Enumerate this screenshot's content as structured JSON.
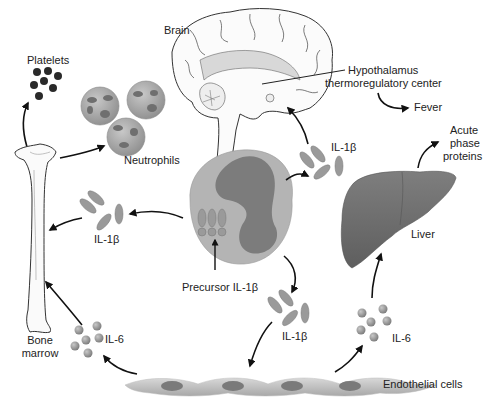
{
  "diagram": {
    "labels": {
      "brain": "Brain",
      "hypothalamus_line1": "Hypothalamus",
      "hypothalamus_line2": "thermoregulatory center",
      "fever": "Fever",
      "platelets": "Platelets",
      "neutrophils": "Neutrophils",
      "acute_line1": "Acute",
      "acute_line2": "phase",
      "acute_line3": "proteins",
      "liver": "Liver",
      "il1b_top": "IL-1β",
      "il1b_left": "IL-1β",
      "il1b_bottom": "IL-1β",
      "precursor": "Precursor IL-1β",
      "il6_left": "IL-6",
      "il6_right": "IL-6",
      "bone_line1": "Bone",
      "bone_line2": "marrow",
      "endothelial": "Endothelial cells"
    },
    "nodes": [
      "Brain",
      "Hypothalamus thermoregulatory center",
      "Fever",
      "Platelets",
      "Neutrophils",
      "Bone marrow",
      "Monocyte (Precursor IL-1β)",
      "Liver",
      "Acute phase proteins",
      "Endothelial cells",
      "IL-1β",
      "IL-6"
    ],
    "edges": [
      {
        "from": "Monocyte",
        "to": "IL-1β (top)",
        "then": "Brain"
      },
      {
        "from": "Hypothalamus thermoregulatory center",
        "to": "Fever"
      },
      {
        "from": "Monocyte",
        "to": "IL-1β (left)",
        "then": "Bone marrow"
      },
      {
        "from": "Bone marrow",
        "to": "Platelets"
      },
      {
        "from": "Bone marrow",
        "to": "Neutrophils"
      },
      {
        "from": "Monocyte",
        "to": "IL-1β (bottom)",
        "then": "Endothelial cells"
      },
      {
        "from": "Endothelial cells",
        "to": "IL-6 (left)",
        "then": "Bone marrow"
      },
      {
        "from": "Endothelial cells",
        "to": "IL-6 (right)",
        "then": "Liver"
      },
      {
        "from": "Liver",
        "to": "Acute phase proteins"
      }
    ],
    "colors": {
      "background": "#ffffff",
      "text": "#222222",
      "arrow": "#111111",
      "cytokine_fill": "#9a9a9a",
      "monocyte_outer": "#b4b4b4",
      "monocyte_nucleus": "#7c7c7c",
      "liver": "#6e6e6e",
      "platelet": "#2a2a2a"
    }
  }
}
